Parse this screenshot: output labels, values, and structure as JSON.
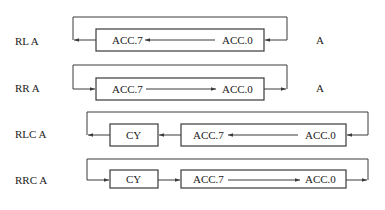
{
  "diagram": {
    "type": "rotate-instructions",
    "rows": [
      {
        "id": "rl",
        "instruction": "RL A",
        "operand_label": "A",
        "cells": [
          {
            "label_left": "ACC.7",
            "label_right": "ACC.0"
          }
        ],
        "direction": "left"
      },
      {
        "id": "rr",
        "instruction": "RR A",
        "operand_label": "A",
        "cells": [
          {
            "label_left": "ACC.7",
            "label_right": "ACC.0"
          }
        ],
        "direction": "right"
      },
      {
        "id": "rlc",
        "instruction": "RLC  A",
        "carry_label": "CY",
        "cells": [
          {
            "label_left": "ACC.7",
            "label_right": "ACC.0"
          }
        ],
        "direction": "left"
      },
      {
        "id": "rrc",
        "instruction": "RRC  A",
        "carry_label": "CY",
        "cells": [
          {
            "label_left": "ACC.7",
            "label_right": "ACC.0"
          }
        ],
        "direction": "right"
      }
    ],
    "colors": {
      "line": "#3a3a3a",
      "text": "#222222",
      "background": "#ffffff"
    }
  }
}
